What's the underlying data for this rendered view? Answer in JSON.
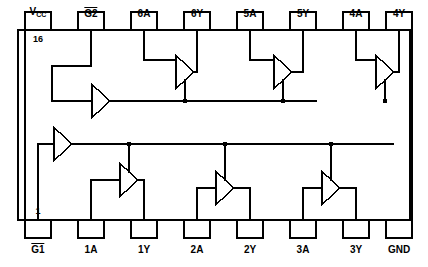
{
  "diagram": {
    "device": "16-pin hex buffer / line driver logic diagram",
    "stroke_color": "#000000",
    "background_color": "#ffffff",
    "line_width": 1.4,
    "body": {
      "x": 18,
      "y": 30,
      "width": 392,
      "height": 190
    },
    "pin_box": {
      "width": 26,
      "height": 18
    },
    "top_pins": [
      {
        "number": "16",
        "label_html": "Vcc",
        "label_text": "VCC",
        "label_kind": "subscript",
        "base": "V",
        "sub": "CC",
        "x": 38,
        "show_number": true
      },
      {
        "number": "15",
        "label_text": "G2",
        "label_kind": "overline",
        "x": 91,
        "show_number": false
      },
      {
        "number": "14",
        "label_text": "6A",
        "label_kind": "plain",
        "x": 144,
        "show_number": false
      },
      {
        "number": "13",
        "label_text": "6Y",
        "label_kind": "plain",
        "x": 197,
        "show_number": false
      },
      {
        "number": "12",
        "label_text": "5A",
        "label_kind": "plain",
        "x": 250,
        "show_number": false
      },
      {
        "number": "11",
        "label_text": "5Y",
        "label_kind": "plain",
        "x": 303,
        "show_number": false
      },
      {
        "number": "10",
        "label_text": "4A",
        "label_kind": "plain",
        "x": 356,
        "show_number": false
      },
      {
        "number": "9",
        "label_text": "4Y",
        "label_kind": "plain",
        "x": 399,
        "show_number": false
      }
    ],
    "bottom_pins": [
      {
        "number": "1",
        "label_text": "G1",
        "label_kind": "overline",
        "x": 38,
        "show_number": true
      },
      {
        "number": "2",
        "label_text": "1A",
        "label_kind": "plain",
        "x": 91,
        "show_number": false
      },
      {
        "number": "3",
        "label_text": "1Y",
        "label_kind": "plain",
        "x": 144,
        "show_number": false
      },
      {
        "number": "4",
        "label_text": "2A",
        "label_kind": "plain",
        "x": 197,
        "show_number": false
      },
      {
        "number": "5",
        "label_text": "2Y",
        "label_kind": "plain",
        "x": 250,
        "show_number": false
      },
      {
        "number": "6",
        "label_text": "3A",
        "label_kind": "plain",
        "x": 303,
        "show_number": false
      },
      {
        "number": "7",
        "label_text": "3Y",
        "label_kind": "plain",
        "x": 356,
        "show_number": false
      },
      {
        "number": "8",
        "label_text": "GND",
        "label_kind": "plain",
        "x": 399,
        "show_number": false
      }
    ],
    "buffers": [
      {
        "name": "enable-buffer-g2",
        "tip_x": 110,
        "center_y": 101,
        "size": 18,
        "dir": "right"
      },
      {
        "name": "enable-buffer-g1",
        "tip_x": 72,
        "center_y": 144,
        "size": 18,
        "dir": "right"
      },
      {
        "name": "buffer-6",
        "tip_x": 194,
        "center_y": 72,
        "size": 18,
        "dir": "right"
      },
      {
        "name": "buffer-5",
        "tip_x": 292,
        "center_y": 72,
        "size": 18,
        "dir": "right"
      },
      {
        "name": "buffer-4",
        "tip_x": 394,
        "center_y": 72,
        "size": 18,
        "dir": "right"
      },
      {
        "name": "buffer-1",
        "tip_x": 138,
        "center_y": 180,
        "size": 18,
        "dir": "right"
      },
      {
        "name": "buffer-2",
        "tip_x": 234,
        "center_y": 188,
        "size": 18,
        "dir": "right"
      },
      {
        "name": "buffer-3",
        "tip_x": 340,
        "center_y": 188,
        "size": 18,
        "dir": "right"
      }
    ]
  }
}
